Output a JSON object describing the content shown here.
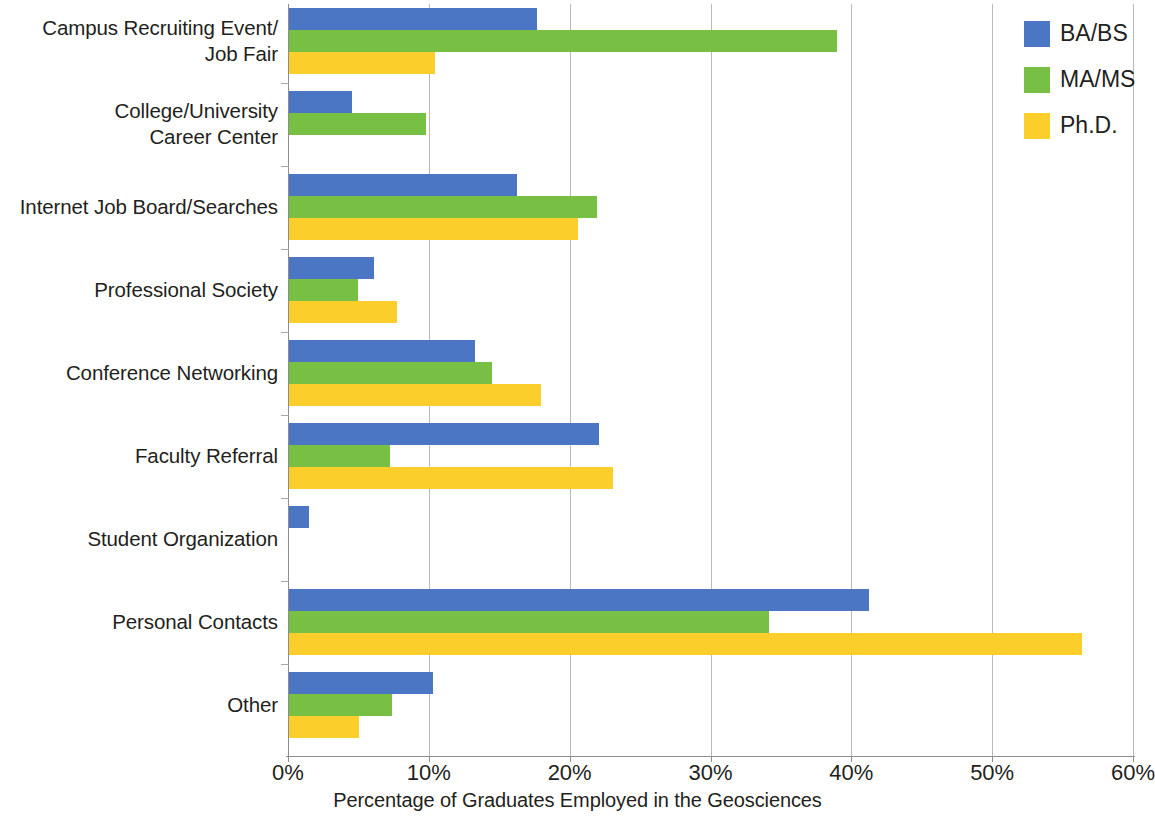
{
  "chart_data": {
    "type": "bar",
    "orientation": "horizontal",
    "title": "",
    "xlabel": "Percentage of Graduates Employed in the Geosciences",
    "ylabel": "",
    "xlim": [
      0,
      60
    ],
    "xticks": [
      0,
      10,
      20,
      30,
      40,
      50,
      60
    ],
    "xtick_labels": [
      "0%",
      "10%",
      "20%",
      "30%",
      "40%",
      "50%",
      "60%"
    ],
    "grid": "vertical",
    "legend_position": "top-right",
    "categories": [
      "Campus Recruiting Event/\nJob Fair",
      "College/University\nCareer Center",
      "Internet Job Board/Searches",
      "Professional Society",
      "Conference Networking",
      "Faculty Referral",
      "Student Organization",
      "Personal Contacts",
      "Other"
    ],
    "category_lines": [
      [
        "Campus Recruiting Event/",
        "Job Fair"
      ],
      [
        "College/University",
        "Career Center"
      ],
      [
        "Internet Job Board/Searches"
      ],
      [
        "Professional Society"
      ],
      [
        "Conference Networking"
      ],
      [
        "Faculty Referral"
      ],
      [
        "Student Organization"
      ],
      [
        "Personal Contacts"
      ],
      [
        "Other"
      ]
    ],
    "series": [
      {
        "name": "BA/BS",
        "color": "#4a76c4",
        "values": [
          17.6,
          4.5,
          16.2,
          6.0,
          13.2,
          22.0,
          1.4,
          41.2,
          10.2
        ]
      },
      {
        "name": "MA/MS",
        "color": "#77c043",
        "values": [
          38.9,
          9.7,
          21.9,
          4.9,
          14.4,
          7.2,
          0,
          34.1,
          7.3
        ]
      },
      {
        "name": "Ph.D.",
        "color": "#fcce2b",
        "values": [
          10.4,
          0,
          20.5,
          7.7,
          17.9,
          23.0,
          0,
          56.3,
          5.0
        ]
      }
    ]
  },
  "legend": {
    "items": [
      {
        "label": "BA/BS",
        "color": "#4a76c4"
      },
      {
        "label": "MA/MS",
        "color": "#77c043"
      },
      {
        "label": "Ph.D.",
        "color": "#fcce2b"
      }
    ]
  },
  "axis": {
    "x_title": "Percentage of Graduates Employed in the Geosciences",
    "tick_labels": [
      "0%",
      "10%",
      "20%",
      "30%",
      "40%",
      "50%",
      "60%"
    ]
  },
  "colors": {
    "ba_bs": "#4a76c4",
    "ma_ms": "#77c043",
    "phd": "#fcce2b",
    "gridline": "#b9b9b9",
    "axis": "#8d8d8d",
    "text": "#231f20",
    "background": "#ffffff"
  }
}
